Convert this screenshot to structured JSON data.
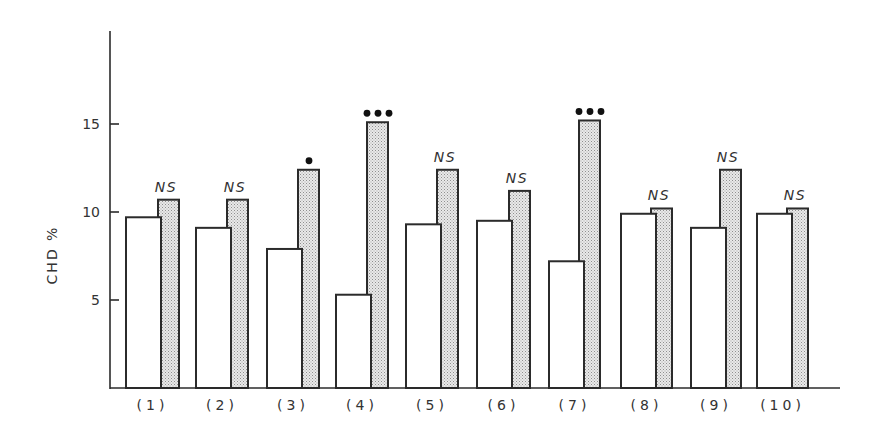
{
  "chart_data": {
    "type": "bar",
    "title": "",
    "xlabel": "",
    "ylabel": "CHD %",
    "ylim": [
      0,
      20
    ],
    "yticks": [
      5,
      10,
      15
    ],
    "grid": false,
    "legend": null,
    "categories": [
      "(1)",
      "(2)",
      "(3)",
      "(4)",
      "(5)",
      "(6)",
      "(7)",
      "(8)",
      "(9)",
      "(10)"
    ],
    "series": [
      {
        "name": "white (open) bars",
        "fill": "#ffffff",
        "values": [
          9.7,
          9.1,
          7.9,
          5.3,
          9.3,
          9.5,
          7.2,
          9.9,
          9.1,
          9.9
        ]
      },
      {
        "name": "stippled bars",
        "fill": "stipple",
        "values": [
          10.7,
          10.7,
          12.4,
          15.1,
          12.4,
          11.2,
          15.2,
          10.2,
          12.4,
          10.2
        ]
      }
    ],
    "annotations": [
      "NS",
      "NS",
      "•",
      "•••",
      "NS",
      "NS",
      "•••",
      "NS",
      "NS",
      "NS"
    ]
  },
  "layout": {
    "axis_x": 110,
    "axis_top": 31,
    "baseline_y": 388,
    "axis_right": 840,
    "px_per_unit": 17.6,
    "white_left": [
      126,
      196,
      267,
      336,
      406,
      477,
      549,
      621,
      691,
      757
    ],
    "white_width": 35,
    "stipple_left": [
      161,
      230,
      301,
      370,
      440,
      512,
      582,
      654,
      723,
      790
    ],
    "stipple_width": 18,
    "label_y": 410
  },
  "colors": {
    "line": "#2b2b2b",
    "stipple_bg": "#e6e6e6",
    "stipple_dot": "#9a9a9a",
    "text": "#333333"
  }
}
